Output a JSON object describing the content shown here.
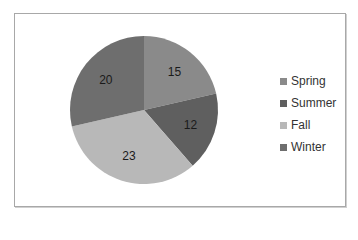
{
  "chart_data": {
    "type": "pie",
    "title": "",
    "categories": [
      "Spring",
      "Summer",
      "Fall",
      "Winter"
    ],
    "values": [
      15,
      12,
      23,
      20
    ],
    "colors": [
      "#8a8a8a",
      "#5f5f5f",
      "#b8b8b8",
      "#6e6e6e"
    ],
    "data_labels": [
      "15",
      "12",
      "23",
      "20"
    ],
    "legend_position": "right"
  },
  "legend": {
    "items": [
      {
        "label": "Spring",
        "color": "#8a8a8a"
      },
      {
        "label": "Summer",
        "color": "#5f5f5f"
      },
      {
        "label": "Fall",
        "color": "#b8b8b8"
      },
      {
        "label": "Winter",
        "color": "#6e6e6e"
      }
    ]
  }
}
